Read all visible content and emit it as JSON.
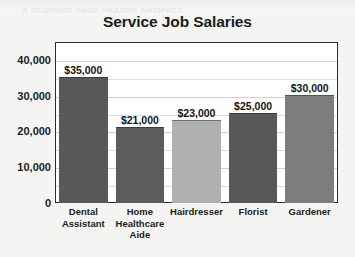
{
  "figure": {
    "ghost_text": "A SCANNED PAGE HEADER ARTIFACT",
    "background_color": "#f4f4f3",
    "plot_background_color": "#ffffff",
    "frame_color": "#2c2c2c"
  },
  "chart_data": {
    "type": "bar",
    "title": "Service Job Salaries",
    "xlabel": "",
    "ylabel": "",
    "categories": [
      "Dental Assistant",
      "Home Healthcare Aide",
      "Hairdresser",
      "Florist",
      "Gardener"
    ],
    "values": [
      35000,
      21000,
      23000,
      25000,
      30000
    ],
    "data_labels": [
      "$35,000",
      "$21,000",
      "$23,000",
      "$25,000",
      "$30,000"
    ],
    "bar_colors": [
      "#595959",
      "#5c5c5c",
      "#b0b0b0",
      "#585858",
      "#7d7d7d"
    ],
    "ylim": [
      0,
      45000
    ],
    "yticks": [
      0,
      10000,
      20000,
      30000,
      40000
    ],
    "ytick_labels": [
      "0",
      "10,000",
      "20,000",
      "30,000",
      "40,000"
    ],
    "gridlines": [
      5000,
      10000,
      15000,
      20000,
      25000,
      30000,
      35000,
      40000
    ],
    "grid": true,
    "legend": null,
    "legend_position": "none"
  }
}
